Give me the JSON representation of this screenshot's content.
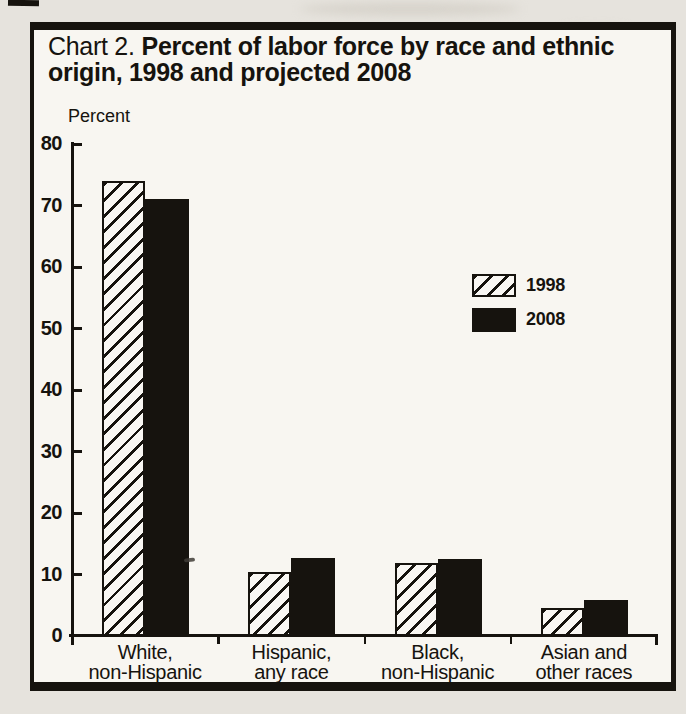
{
  "scan": {
    "outer_background": "#e6e3dd",
    "paper": "#f8f6f1",
    "ink": "#16130e"
  },
  "title": {
    "prefix": "Chart 2.",
    "bold_line1": "Percent of labor force by race and ethnic",
    "bold_line2": "origin, 1998 and projected 2008"
  },
  "chart_data": {
    "type": "bar",
    "ylabel": "Percent",
    "xlabel": "",
    "categories": [
      {
        "line1": "White,",
        "line2": "non-Hispanic"
      },
      {
        "line1": "Hispanic,",
        "line2": "any race"
      },
      {
        "line1": "Black,",
        "line2": "non-Hispanic"
      },
      {
        "line1": "Asian and",
        "line2": "other races"
      }
    ],
    "series": [
      {
        "name": "1998",
        "style": "hatched-diagonal",
        "values": [
          74,
          10.4,
          11.9,
          4.6
        ]
      },
      {
        "name": "2008",
        "style": "solid-black",
        "values": [
          71,
          12.7,
          12.6,
          5.9
        ]
      }
    ],
    "ylim": [
      0,
      80
    ],
    "yticks": [
      0,
      10,
      20,
      30,
      40,
      50,
      60,
      70,
      80
    ],
    "grid": false,
    "legend_position": "center-right"
  },
  "legend": {
    "items": [
      {
        "label": "1998",
        "swatch": "hatched"
      },
      {
        "label": "2008",
        "swatch": "solid"
      }
    ]
  }
}
